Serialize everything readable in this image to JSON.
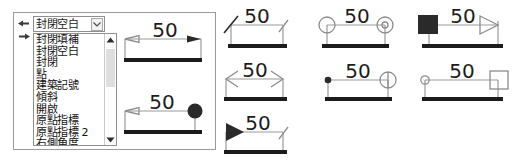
{
  "dialog": {
    "gutter_icons": [
      "arrow-left-icon",
      "arrow-right-icon"
    ],
    "combo": {
      "name": "arrowhead-style-combo",
      "value": "封閉空白",
      "arrow_icon": "chevron-down-icon"
    },
    "listbox": {
      "name": "arrowhead-style-list",
      "items": [
        "封閉填補",
        "封閉空白",
        "封閉",
        "點",
        "建築記號",
        "傾斜",
        "開啟",
        "原點指標",
        "原點指標 2",
        "右側角度"
      ],
      "selected": "封閉空白",
      "scrollbar": {
        "up_icon": "scroll-up-arrow-icon",
        "down_icon": "scroll-down-arrow-icon"
      }
    },
    "previews": [
      {
        "name": "preview-closed-blank",
        "label": "50",
        "left_glyph": "open-arrow-head",
        "right_glyph": "filled-arrow-head"
      },
      {
        "name": "preview-dot",
        "label": "50",
        "left_glyph": "open-arrow-head",
        "right_glyph": "filled-dot"
      }
    ]
  },
  "samples": [
    {
      "name": "sample-oblique",
      "label": "50",
      "left_glyph": "oblique-tick",
      "right_glyph": "small-oblique-tick"
    },
    {
      "name": "sample-origin-indicator",
      "label": "50",
      "left_glyph": "open-circle",
      "right_glyph": "circle-with-dot"
    },
    {
      "name": "sample-architectural",
      "label": "50",
      "left_glyph": "filled-square",
      "right_glyph": "open-triangle-arrow"
    },
    {
      "name": "sample-open-arrow",
      "label": "50",
      "left_glyph": "line-arrow-left",
      "right_glyph": "line-arrow-right"
    },
    {
      "name": "sample-dot-small",
      "label": "50",
      "left_glyph": "small-filled-dot",
      "right_glyph": "circle-with-tick"
    },
    {
      "name": "sample-open-circle-box",
      "label": "50",
      "left_glyph": "small-open-circle",
      "right_glyph": "open-box"
    },
    {
      "name": "sample-filled-triangle",
      "label": "50",
      "left_glyph": "filled-triangle",
      "right_glyph": "small-oblique-tick"
    }
  ],
  "colors": {
    "baseline": "#1c1c1c",
    "dimension_line": "#9a9a9a",
    "glyph": "#2a2a2a",
    "panel_border": "#9a9a9a",
    "scroll_thumb": "#dedede"
  }
}
